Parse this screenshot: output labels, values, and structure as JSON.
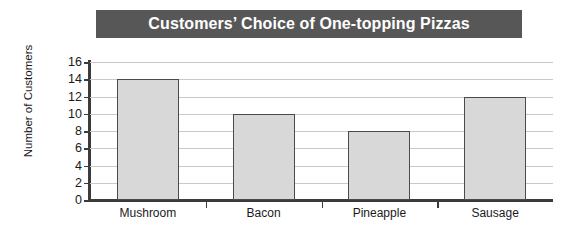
{
  "chart_data": {
    "type": "bar",
    "title": "Customers’ Choice of One-topping Pizzas",
    "xlabel": "",
    "ylabel": "Number of Customers",
    "categories": [
      "Mushroom",
      "Bacon",
      "Pineapple",
      "Sausage"
    ],
    "values": [
      14,
      10,
      8,
      12
    ],
    "ylim": [
      0,
      16
    ],
    "ytick_labels": [
      "0",
      "2",
      "4",
      "6",
      "8",
      "10",
      "12",
      "14",
      "16"
    ],
    "ytick_values": [
      0,
      2,
      4,
      6,
      8,
      10,
      12,
      14,
      16
    ],
    "grid": true,
    "legend": false,
    "colors": {
      "bar_fill": "#d8d8d8",
      "bar_border": "#4a4a4a",
      "title_background": "#575757",
      "title_text": "#ffffff",
      "gridline": "#c9c9c9",
      "axis": "#3b3b3b",
      "text": "#1a1a1a",
      "background": "#ffffff"
    }
  }
}
